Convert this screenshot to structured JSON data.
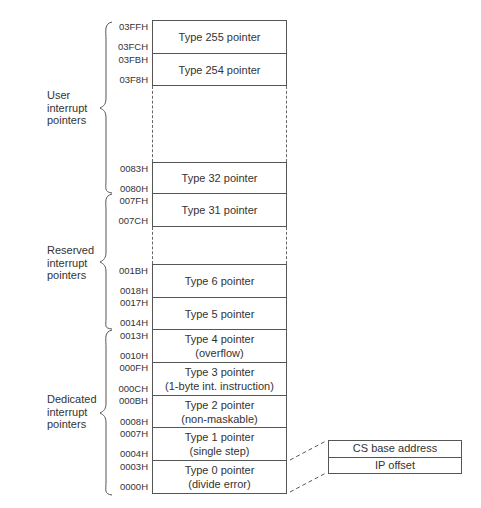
{
  "diagram": {
    "groups": [
      {
        "label_lines": [
          "User",
          "interrupt",
          "pointers"
        ]
      },
      {
        "label_lines": [
          "Reserved",
          "interrupt",
          "pointers"
        ]
      },
      {
        "label_lines": [
          "Dedicated",
          "interrupt",
          "pointers"
        ]
      }
    ],
    "entries": [
      {
        "high": "03FFH",
        "low": "03FCH",
        "lines": [
          "Type 255 pointer"
        ]
      },
      {
        "high": "03FBH",
        "low": "03F8H",
        "lines": [
          "Type 254 pointer"
        ]
      },
      {
        "high": "0083H",
        "low": "0080H",
        "lines": [
          "Type 32 pointer"
        ]
      },
      {
        "high": "007FH",
        "low": "007CH",
        "lines": [
          "Type 31 pointer"
        ]
      },
      {
        "high": "001BH",
        "low": "0018H",
        "lines": [
          "Type 6 pointer"
        ]
      },
      {
        "high": "0017H",
        "low": "0014H",
        "lines": [
          "Type 5 pointer"
        ]
      },
      {
        "high": "0013H",
        "low": "0010H",
        "lines": [
          "Type 4 pointer",
          "(overflow)"
        ]
      },
      {
        "high": "000FH",
        "low": "000CH",
        "lines": [
          "Type 3 pointer",
          "(1-byte int. instruction)"
        ]
      },
      {
        "high": "000BH",
        "low": "0008H",
        "lines": [
          "Type 2 pointer",
          "(non-maskable)"
        ]
      },
      {
        "high": "0007H",
        "low": "0004H",
        "lines": [
          "Type 1 pointer",
          "(single step)"
        ]
      },
      {
        "high": "0003H",
        "low": "0000H",
        "lines": [
          "Type 0 pointer",
          "(divide error)"
        ]
      }
    ],
    "detail": {
      "rows": [
        "CS base address",
        "IP offset"
      ]
    }
  }
}
